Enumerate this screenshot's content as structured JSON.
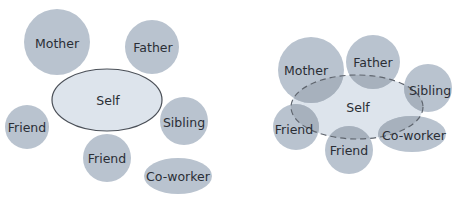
{
  "colors": {
    "circle_fill": "#b9c3cf",
    "self_fill": "#dde4ec",
    "self_stroke": "#4a4f57",
    "dashed_stroke": "#5f656e",
    "overlap_fill": "#a7b1bd",
    "text": "#2a2e35"
  },
  "left_panel": {
    "self": "Self",
    "nodes": {
      "mother": "Mother",
      "father": "Father",
      "friend_left": "Friend",
      "sibling": "Sibling",
      "friend_bottom": "Friend",
      "coworker": "Co-worker"
    }
  },
  "right_panel": {
    "self": "Self",
    "nodes": {
      "mother": "Mother",
      "father": "Father",
      "sibling": "Sibling",
      "friend_left": "Friend",
      "friend_bottom": "Friend",
      "coworker": "Co-worker"
    }
  }
}
